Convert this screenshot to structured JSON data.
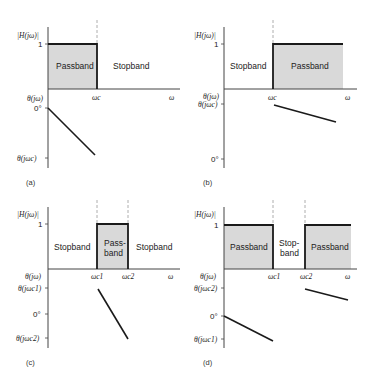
{
  "figure": {
    "colors": {
      "passband_fill": "#d9d9d9",
      "line": "#1a1a1a",
      "axis": "#444444",
      "dashed": "#999999"
    },
    "panels": [
      {
        "caption": "(a)",
        "y_label": "|H(jω)|",
        "one": "1",
        "x_label": "ω",
        "phase_label": "θ(jω)",
        "cutoffs": [
          "ωc"
        ],
        "bands": [
          "Passband",
          "Stopband"
        ],
        "phase_ticks": [
          "0°",
          "θ(jωc)"
        ]
      },
      {
        "caption": "(b)",
        "y_label": "|H(jω)|",
        "one": "1",
        "x_label": "ω",
        "phase_label": "θ(jω)",
        "cutoffs": [
          "ωc"
        ],
        "bands": [
          "Stopband",
          "Passband"
        ],
        "phase_ticks": [
          "θ(jωc)",
          "0°"
        ]
      },
      {
        "caption": "(c)",
        "y_label": "|H(jω)|",
        "one": "1",
        "x_label": "ω",
        "phase_label": "θ(jω)",
        "cutoffs": [
          "ωc1",
          "ωc2"
        ],
        "bands": [
          "Stopband",
          "Pass-",
          "band",
          "Stopband"
        ],
        "phase_ticks": [
          "θ(jωc1)",
          "0°",
          "θ(jωc2)"
        ]
      },
      {
        "caption": "(d)",
        "y_label": "|H(jω)|",
        "one": "1",
        "x_label": "ω",
        "phase_label": "θ(jω)",
        "cutoffs": [
          "ωc1",
          "ωc2"
        ],
        "bands": [
          "Passband",
          "Stop-",
          "band",
          "Passband"
        ],
        "phase_ticks": [
          "θ(jωc2)",
          "0°",
          "θ(jωc1)"
        ]
      }
    ]
  }
}
